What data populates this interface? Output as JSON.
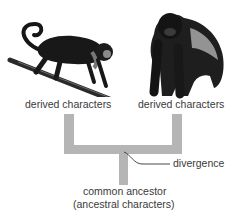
{
  "diagram": {
    "left_taxon": {
      "image": "monkey-icon",
      "label": "derived characters"
    },
    "right_taxon": {
      "image": "gorilla-icon",
      "label": "derived characters"
    },
    "divergence_label": "divergence",
    "ancestor": {
      "line1": "common ancestor",
      "line2": "(ancestral characters)"
    },
    "colors": {
      "branch": "#b5b5b5",
      "text": "#3a3a3a",
      "animal": "#1a1a1a"
    }
  }
}
